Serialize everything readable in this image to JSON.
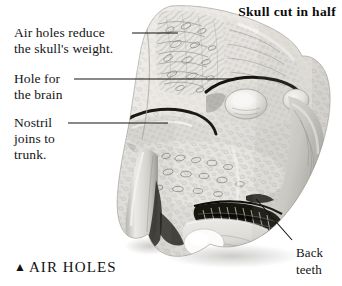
{
  "figure": {
    "title": "Skull cut in half",
    "caption_marker": "▲",
    "caption": "AIR HOLES",
    "background_color": "#ffffff",
    "ink_color": "#141414"
  },
  "labels": [
    {
      "id": "air-holes",
      "line1": "Air holes reduce",
      "line2": "the skull's weight.",
      "leader": {
        "x1": 132,
        "y1": 33,
        "x2": 178,
        "y2": 33
      }
    },
    {
      "id": "hole-for-brain",
      "line1": "Hole for",
      "line2": "the brain",
      "leader": {
        "x1": 74,
        "y1": 79,
        "x2": 238,
        "y2": 79
      }
    },
    {
      "id": "nostril",
      "line1": "Nostril",
      "line2": "joins to",
      "line3": "trunk.",
      "leader": {
        "x1": 68,
        "y1": 123,
        "x2": 168,
        "y2": 123
      }
    },
    {
      "id": "back-teeth",
      "line1": "Back",
      "line2": "teeth",
      "leader": {
        "x1": 256,
        "y1": 199,
        "x2": 292,
        "y2": 240
      }
    }
  ],
  "illustration_parts": [
    "cranium-top",
    "air-hole-honeycomb-bone",
    "brain-cavity",
    "nostril-passage",
    "tusk-socket",
    "back-teeth-molars",
    "lower-jaw",
    "occipital-condyle"
  ]
}
